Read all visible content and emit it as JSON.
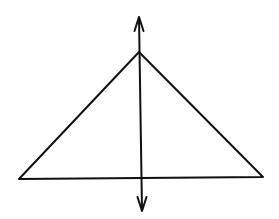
{
  "diagram": {
    "description": "Triangle with vertical line of symmetry (double-headed arrow) through apex",
    "stroke_color": "#111111",
    "background_color": "#ffffff",
    "triangle": {
      "apex": [
        139,
        52
      ],
      "base_left": [
        19,
        179
      ],
      "base_right": [
        263,
        177
      ]
    },
    "symmetry_line": {
      "top": [
        139,
        17
      ],
      "bottom": [
        142,
        211
      ],
      "arrowheads": "both"
    }
  }
}
